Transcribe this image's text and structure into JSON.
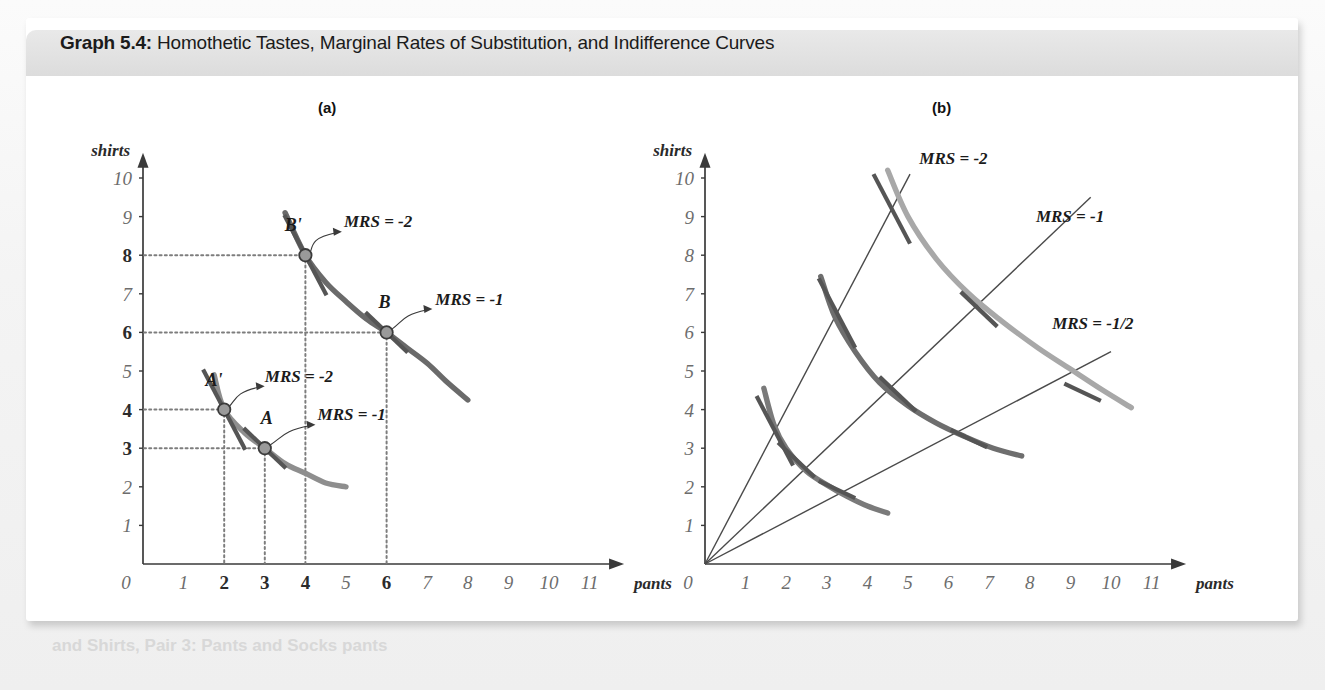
{
  "figure": {
    "number_label": "Graph 5.4:",
    "title": "Homothetic Tastes, Marginal Rates of Substitution, and Indifference Curves"
  },
  "panels": {
    "a": {
      "caption": "(a)"
    },
    "b": {
      "caption": "(b)"
    }
  },
  "ghost": {
    "top": "for use on the plane",
    "bottom": "and Shirts, Pair 3: Pants and Socks pants",
    "mid": "bus"
  },
  "axes": {
    "x_label": "pants",
    "y_label": "shirts",
    "x_ticks": [
      "0",
      "1",
      "2",
      "3",
      "4",
      "5",
      "6",
      "7",
      "8",
      "9",
      "10",
      "11"
    ],
    "y_ticks": [
      "1",
      "2",
      "3",
      "4",
      "5",
      "6",
      "7",
      "8",
      "9",
      "10"
    ],
    "x_range": [
      0,
      11.8
    ],
    "y_range": [
      0,
      10.6
    ]
  },
  "chart_data": [
    {
      "type": "line",
      "panel": "a",
      "title": "(a)",
      "xlabel": "pants",
      "ylabel": "shirts",
      "xlim": [
        0,
        11.8
      ],
      "ylim": [
        0,
        10.6
      ],
      "grid": false,
      "legend": "none",
      "highlighted_x_ticks": [
        "2",
        "3",
        "4",
        "6"
      ],
      "highlighted_y_ticks": [
        "3",
        "4",
        "6",
        "8"
      ],
      "series": [
        {
          "name": "lower indifference curve",
          "color": "#8e8e8e",
          "points": [
            [
              1.75,
              4.9
            ],
            [
              2.0,
              4.0
            ],
            [
              2.5,
              3.4
            ],
            [
              3.0,
              3.0
            ],
            [
              3.5,
              2.6
            ],
            [
              4.0,
              2.35
            ],
            [
              4.5,
              2.1
            ],
            [
              5.0,
              2.0
            ]
          ]
        },
        {
          "name": "upper indifference curve",
          "color": "#6a6a6a",
          "points": [
            [
              3.5,
              9.1
            ],
            [
              4.0,
              8.0
            ],
            [
              4.5,
              7.3
            ],
            [
              5.0,
              6.8
            ],
            [
              5.5,
              6.35
            ],
            [
              6.0,
              6.0
            ],
            [
              6.5,
              5.6
            ],
            [
              7.0,
              5.2
            ],
            [
              7.5,
              4.7
            ],
            [
              8.0,
              4.25
            ]
          ]
        }
      ],
      "annotations": [
        {
          "name": "A",
          "x": 3,
          "y": 3,
          "mrs": "MRS = -1",
          "tangent_slope": -1
        },
        {
          "name": "A'",
          "x": 2,
          "y": 4,
          "mrs": "MRS = -2",
          "tangent_slope": -2
        },
        {
          "name": "B",
          "x": 6,
          "y": 6,
          "mrs": "MRS = -1",
          "tangent_slope": -1
        },
        {
          "name": "B'",
          "x": 4,
          "y": 8,
          "mrs": "MRS = -2",
          "tangent_slope": -2
        }
      ]
    },
    {
      "type": "line",
      "panel": "b",
      "title": "(b)",
      "xlabel": "pants",
      "ylabel": "shirts",
      "xlim": [
        0,
        11.8
      ],
      "ylim": [
        0,
        10.6
      ],
      "grid": false,
      "legend": "none",
      "series": [
        {
          "name": "indifference curve 1 (innermost)",
          "color": "#7a7a7a",
          "points": [
            [
              1.45,
              4.55
            ],
            [
              1.7,
              3.6
            ],
            [
              2.0,
              3.0
            ],
            [
              2.5,
              2.4
            ],
            [
              3.0,
              2.05
            ],
            [
              3.5,
              1.75
            ],
            [
              4.0,
              1.5
            ],
            [
              4.5,
              1.32
            ]
          ]
        },
        {
          "name": "indifference curve 2 (middle)",
          "color": "#6e6e6e",
          "points": [
            [
              2.85,
              7.45
            ],
            [
              3.2,
              6.4
            ],
            [
              3.7,
              5.5
            ],
            [
              4.3,
              4.7
            ],
            [
              5.0,
              4.1
            ],
            [
              5.7,
              3.65
            ],
            [
              6.4,
              3.3
            ],
            [
              7.1,
              3.0
            ],
            [
              7.8,
              2.8
            ]
          ]
        },
        {
          "name": "indifference curve 3 (outermost)",
          "color": "#a8a8a8",
          "points": [
            [
              4.5,
              10.2
            ],
            [
              5.0,
              9.0
            ],
            [
              5.7,
              7.9
            ],
            [
              6.5,
              7.0
            ],
            [
              7.3,
              6.3
            ],
            [
              8.2,
              5.6
            ],
            [
              9.0,
              5.05
            ],
            [
              9.8,
              4.5
            ],
            [
              10.5,
              4.05
            ]
          ]
        }
      ],
      "rays": [
        {
          "name": "ray-mrs-2",
          "label": "MRS = -2",
          "slope": 2.0,
          "x_end": 5.05,
          "label_x": 5.28,
          "label_y": 10.35
        },
        {
          "name": "ray-mrs-1",
          "label": "MRS = -1",
          "slope": 1.0,
          "x_end": 9.5,
          "label_x": 8.15,
          "label_y": 8.85
        },
        {
          "name": "ray-mrs-half",
          "label": "MRS = -1/2",
          "slope": 0.55,
          "x_end": 10.0,
          "label_x": 8.55,
          "label_y": 6.1
        }
      ],
      "tangency_points": [
        {
          "ray": "ray-mrs-2",
          "x": 1.72,
          "y": 3.45,
          "slope": -2
        },
        {
          "ray": "ray-mrs-2",
          "x": 3.25,
          "y": 6.5,
          "slope": -2
        },
        {
          "ray": "ray-mrs-2",
          "x": 4.6,
          "y": 9.2,
          "slope": -2
        },
        {
          "ray": "ray-mrs-1",
          "x": 2.25,
          "y": 2.7,
          "slope": -1
        },
        {
          "ray": "ray-mrs-1",
          "x": 4.75,
          "y": 4.4,
          "slope": -1
        },
        {
          "ray": "ray-mrs-1",
          "x": 6.75,
          "y": 6.6,
          "slope": -1
        },
        {
          "ray": "ray-mrs-half",
          "x": 3.25,
          "y": 1.93,
          "slope": -0.5
        },
        {
          "ray": "ray-mrs-half",
          "x": 6.5,
          "y": 3.25,
          "slope": -0.5
        },
        {
          "ray": "ray-mrs-half",
          "x": 9.3,
          "y": 4.45,
          "slope": -0.5
        }
      ]
    }
  ]
}
